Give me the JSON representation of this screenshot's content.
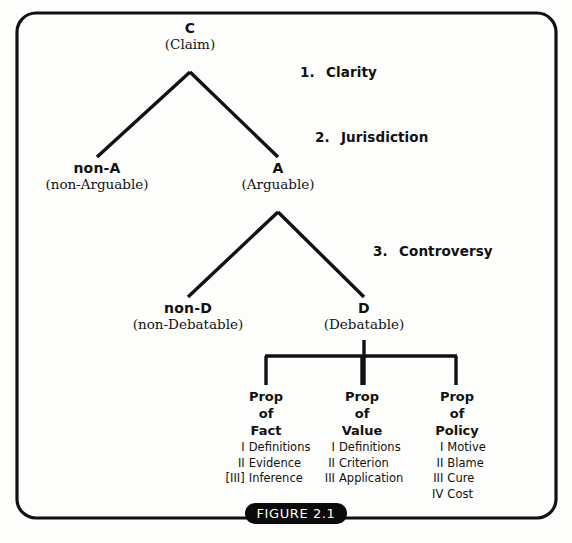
{
  "figure": {
    "caption": "FIGURE 2.1",
    "badge_color": "#0a0a0a",
    "line_color": "#111111",
    "background": "#fdfdfc"
  },
  "tree": {
    "root": {
      "code": "C",
      "desc": "(Claim)"
    },
    "level_a": [
      {
        "code": "non-A",
        "desc": "(non-Arguable)"
      },
      {
        "code": "A",
        "desc": "(Arguable)"
      }
    ],
    "level_d": [
      {
        "code": "non-D",
        "desc": "(non-Debatable)"
      },
      {
        "code": "D",
        "desc": "(Debatable)"
      }
    ]
  },
  "criteria": [
    {
      "num": "1.",
      "label": "Clarity"
    },
    {
      "num": "2.",
      "label": "Jurisdiction"
    },
    {
      "num": "3.",
      "label": "Controversy"
    }
  ],
  "propositions": [
    {
      "line1": "Prop",
      "line2": "of",
      "line3": "Fact",
      "items": [
        {
          "numeral": "I",
          "text": "Definitions"
        },
        {
          "numeral": "II",
          "text": "Evidence"
        },
        {
          "numeral": "[III]",
          "text": "Inference"
        }
      ]
    },
    {
      "line1": "Prop",
      "line2": "of",
      "line3": "Value",
      "items": [
        {
          "numeral": "I",
          "text": "Definitions"
        },
        {
          "numeral": "II",
          "text": "Criterion"
        },
        {
          "numeral": "III",
          "text": "Application"
        }
      ]
    },
    {
      "line1": "Prop",
      "line2": "of",
      "line3": "Policy",
      "items": [
        {
          "numeral": "I",
          "text": "Motive"
        },
        {
          "numeral": "II",
          "text": "Blame"
        },
        {
          "numeral": "III",
          "text": "Cure"
        },
        {
          "numeral": "IV",
          "text": "Cost"
        }
      ]
    }
  ]
}
